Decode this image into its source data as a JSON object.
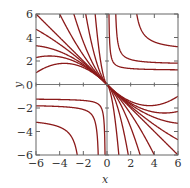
{
  "chart_data": {
    "type": "line",
    "title": "",
    "xlabel": "x",
    "ylabel": "y",
    "xlim": [
      -6,
      6
    ],
    "ylim": [
      -6,
      6
    ],
    "xticks": [
      -6,
      -4,
      -2,
      0,
      2,
      4,
      6
    ],
    "yticks": [
      -6,
      -4,
      -2,
      0,
      2,
      4,
      6
    ],
    "xtick_labels": [
      "−6",
      "−4",
      "−2",
      "0",
      "2",
      "4",
      "6"
    ],
    "ytick_labels": [
      "−6",
      "−4",
      "−2",
      "0",
      "2",
      "4",
      "6"
    ],
    "grid": false,
    "curve_color": "#8b1a1a",
    "frame_color": "#666666",
    "fan_coefficients": [
      5,
      1.3,
      0.408,
      0.125,
      0,
      -0.036,
      -0.075,
      -0.103,
      -0.139
    ],
    "hyperbolas": [
      {
        "a": 0.1,
        "b": 1.2,
        "c": 0.6
      },
      {
        "a": 0.6,
        "b": 1.7,
        "c": 1.2
      },
      {
        "a": 2.0,
        "b": 2.8,
        "c": 3.3
      }
    ]
  }
}
